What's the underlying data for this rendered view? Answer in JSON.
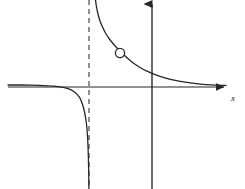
{
  "figure": {
    "title": "",
    "width": 245,
    "height": 189,
    "background_color": "#ffffff",
    "curve_color": "#262626",
    "axis_color": "#262626",
    "asymptote_color": "#555555",
    "hole_fill_color": "#ffffff"
  },
  "axes": {
    "x_axis": {
      "label": "x",
      "label_x": 233,
      "label_y": 101,
      "y_pixel": 87,
      "x_start": 8,
      "x_end": 228,
      "has_arrow": true,
      "arrow_direction": "right"
    },
    "y_axis": {
      "label": "",
      "x_pixel": 152,
      "y_start": 2,
      "y_end": 189,
      "has_arrow": true,
      "arrow_direction": "up"
    },
    "origin": {
      "x": 152,
      "y": 87
    }
  },
  "chart_data": {
    "type": "line",
    "title": "",
    "xlabel": "x",
    "ylabel": "",
    "grid": false,
    "legend": null,
    "xlim": [
      -5,
      3
    ],
    "ylim": [
      -4,
      4
    ],
    "features": {
      "vertical_asymptote": {
        "style": "dashed",
        "x_value": -1.6,
        "x_pixel": 89,
        "y_top_pixel": 0,
        "y_bottom_pixel": 189
      },
      "horizontal_asymptote": {
        "style": "solid-overlapping-x-axis",
        "y_value": 0,
        "y_pixel": 87
      },
      "hole": {
        "kind": "open-circle",
        "x_value": -0.9,
        "y_value": 1.1,
        "x_pixel": 120,
        "y_pixel": 53,
        "radius_pixel": 4.6,
        "filled": false
      }
    },
    "series": [
      {
        "name": "left-branch",
        "comment": "Approaches y=0 from above on the far left, plunges to minus-infinity just left of the vertical asymptote.",
        "points_pixel": [
          [
            8,
            85
          ],
          [
            20,
            85
          ],
          [
            32,
            85.2
          ],
          [
            44,
            85.6
          ],
          [
            54,
            86.2
          ],
          [
            62,
            87.2
          ],
          [
            68,
            88.6
          ],
          [
            72,
            90.4
          ],
          [
            76,
            93.2
          ],
          [
            79,
            96.6
          ],
          [
            81,
            100.4
          ],
          [
            83,
            106
          ],
          [
            84.5,
            112
          ],
          [
            85.8,
            119
          ],
          [
            86.8,
            127
          ],
          [
            87.5,
            136
          ],
          [
            88,
            146
          ],
          [
            88.4,
            158
          ],
          [
            88.7,
            172
          ],
          [
            88.9,
            189
          ]
        ]
      },
      {
        "name": "right-branch",
        "comment": "Descends from plus-infinity just right of the vertical asymptote, passes through the hole, then flattens toward y=0 on the right.",
        "points_pixel": [
          [
            95.5,
            0
          ],
          [
            96.5,
            7
          ],
          [
            98,
            14
          ],
          [
            100,
            21
          ],
          [
            102.5,
            27
          ],
          [
            105.5,
            33
          ],
          [
            109,
            38.5
          ],
          [
            113,
            43.5
          ],
          [
            117,
            48
          ],
          [
            120,
            51
          ],
          [
            124,
            55
          ],
          [
            129,
            59.5
          ],
          [
            134,
            63.5
          ],
          [
            140,
            67.5
          ],
          [
            147,
            71.2
          ],
          [
            155,
            74.6
          ],
          [
            164,
            77.6
          ],
          [
            174,
            80.2
          ],
          [
            185,
            82.2
          ],
          [
            196,
            83.7
          ],
          [
            206,
            84.6
          ],
          [
            216,
            85.2
          ],
          [
            226,
            85.5
          ]
        ]
      }
    ]
  }
}
